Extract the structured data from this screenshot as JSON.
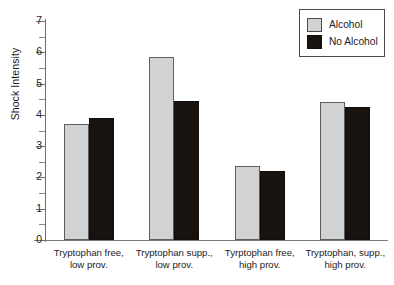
{
  "chart_data": {
    "type": "bar",
    "title": "",
    "xlabel": "",
    "ylabel": "Shock Intensity",
    "ylim": [
      0,
      7
    ],
    "ytick_labels": [
      "0",
      "1",
      "2",
      "3",
      "4",
      "5",
      "6",
      "7"
    ],
    "ytick_values": [
      0,
      1,
      2,
      3,
      4,
      5,
      6,
      7
    ],
    "yminor_values": [
      0.5,
      1.5,
      2.5,
      3.5,
      4.5,
      5.5,
      6.5
    ],
    "grid": false,
    "legend_position": "top-right",
    "categories": [
      "Tryptophan free, low prov.",
      "Tryptophan supp., low prov.",
      "Tyrptophan free, high prov.",
      "Tryptophan, supp., high prov."
    ],
    "category_lines": [
      [
        "Tryptophan free,",
        "low prov."
      ],
      [
        "Tryptophan supp.,",
        "low prov."
      ],
      [
        "Tyrptophan free,",
        "high prov."
      ],
      [
        "Tryptophan, supp.,",
        "high prov."
      ]
    ],
    "series": [
      {
        "name": "Alcohol",
        "color": "#d2d2d2",
        "values": [
          3.7,
          5.85,
          2.35,
          4.4
        ]
      },
      {
        "name": "No Alcohol",
        "color": "#191310",
        "values": [
          3.9,
          4.45,
          2.2,
          4.25
        ]
      }
    ]
  },
  "legend": {
    "items": [
      {
        "label": "Alcohol"
      },
      {
        "label": "No Alcohol"
      }
    ]
  }
}
